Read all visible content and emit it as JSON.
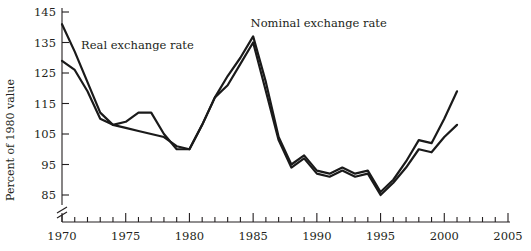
{
  "chart_data": {
    "type": "line",
    "title": "",
    "subtitle": "",
    "xlabel": "",
    "ylabel": "Percent of 1980 value",
    "xlim": [
      1970,
      2005
    ],
    "ylim": [
      83,
      147
    ],
    "ytick_values": [
      85,
      95,
      105,
      115,
      125,
      135,
      145
    ],
    "ytick_labels": [
      "85",
      "95",
      "105",
      "115",
      "125",
      "135",
      "145"
    ],
    "xtick_values": [
      1970,
      1975,
      1980,
      1985,
      1990,
      1995,
      2000,
      2005
    ],
    "xtick_labels": [
      "1970",
      "1975",
      "1980",
      "1985",
      "1990",
      "1995",
      "2000",
      "2005"
    ],
    "minor_xtick_interval": 1,
    "grid": false,
    "legend_position": "inline-annotation",
    "y_axis_break": true,
    "y_axis_break_note": "zig-zag break between 85 and the baseline",
    "annotations": [
      {
        "name": "real-exchange-rate-label",
        "text": "Real exchange rate",
        "x": 1971.5,
        "y": 133
      },
      {
        "name": "nominal-exchange-rate-label",
        "text": "Nominal exchange rate",
        "x": 1984.8,
        "y": 140
      }
    ],
    "series": [
      {
        "name": "Nominal exchange rate",
        "color": "#1a1a1a",
        "x": [
          1970,
          1971,
          1972,
          1973,
          1974,
          1975,
          1976,
          1977,
          1978,
          1979,
          1980,
          1981,
          1982,
          1983,
          1984,
          1985,
          1986,
          1987,
          1988,
          1989,
          1990,
          1991,
          1992,
          1993,
          1994,
          1995,
          1996,
          1997,
          1998,
          1999,
          2000,
          2001
        ],
        "values": [
          141,
          132,
          122,
          112,
          108,
          107,
          106,
          105,
          104,
          101,
          100,
          108,
          117,
          124,
          130,
          137,
          122,
          104,
          95,
          98,
          93,
          92,
          94,
          92,
          93,
          86,
          90,
          96,
          103,
          102,
          110,
          119
        ]
      },
      {
        "name": "Real exchange rate",
        "color": "#1a1a1a",
        "x": [
          1970,
          1971,
          1972,
          1973,
          1974,
          1975,
          1976,
          1977,
          1978,
          1979,
          1980,
          1981,
          1982,
          1983,
          1984,
          1985,
          1986,
          1987,
          1988,
          1989,
          1990,
          1991,
          1992,
          1993,
          1994,
          1995,
          1996,
          1997,
          1998,
          1999,
          2000,
          2001
        ],
        "values": [
          129,
          126,
          119,
          110,
          108,
          109,
          112,
          112,
          105,
          100,
          100,
          108,
          117,
          121,
          128,
          135,
          119,
          103,
          94,
          97,
          92,
          91,
          93,
          91,
          92,
          85,
          89,
          94,
          100,
          99,
          104,
          108
        ]
      }
    ]
  },
  "figure": {
    "background_color": "#ffffff",
    "axis_color": "#231f20",
    "line_color": "#1a1a1a"
  }
}
